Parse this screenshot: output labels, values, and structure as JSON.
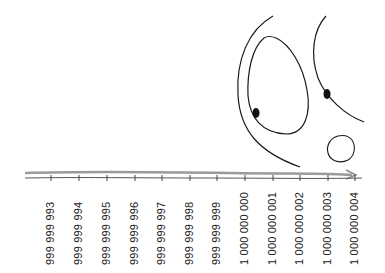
{
  "illustration": {
    "style": "hand-drawn sketch",
    "colors": {
      "ink": "#1a1a1a",
      "arrow": "#9a9a9a",
      "background": "#ffffff"
    },
    "number_line": {
      "ticks": [
        {
          "label": "999 999 993",
          "x": 51
        },
        {
          "label": "999 999 994",
          "x": 79
        },
        {
          "label": "999 999 995",
          "x": 107
        },
        {
          "label": "999 999 996",
          "x": 135
        },
        {
          "label": "999 999 997",
          "x": 162
        },
        {
          "label": "999 999 998",
          "x": 190
        },
        {
          "label": "999 999 999",
          "x": 217
        },
        {
          "label": "1 000 000 000",
          "x": 245
        },
        {
          "label": "1 000 000 001",
          "x": 273
        },
        {
          "label": "1 000 000 002",
          "x": 300
        },
        {
          "label": "1 000 000 003",
          "x": 328
        },
        {
          "label": "1 000 000 004",
          "x": 355
        }
      ]
    },
    "figure": "face with large eyes and small round mouth peering at the number line"
  }
}
